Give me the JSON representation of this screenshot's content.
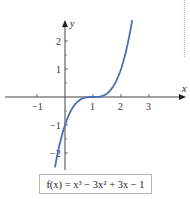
{
  "chart_data": {
    "type": "line",
    "title": "",
    "function": "f(x) = x^3 - 3x^2 + 3x - 1",
    "xlabel": "x",
    "ylabel": "y",
    "x_ticks": [
      -1,
      0,
      1,
      2,
      3
    ],
    "x_tick_labels": [
      "-1",
      "1",
      "2",
      "3"
    ],
    "y_ticks": [
      -2,
      -1,
      0,
      1,
      2
    ],
    "y_tick_labels": [
      "2",
      "1",
      "-1",
      "-2"
    ],
    "xlim": [
      -2.2,
      4.2
    ],
    "ylim": [
      -2.7,
      2.7
    ],
    "grid": false,
    "series": [
      {
        "name": "f(x)",
        "color": "#4a6fb5",
        "x": [
          -0.4,
          -0.2,
          0,
          0.2,
          0.4,
          0.6,
          0.8,
          1.0,
          1.2,
          1.4,
          1.6,
          1.8,
          2.0,
          2.2,
          2.4
        ],
        "y": [
          -2.74,
          -1.73,
          -1,
          -0.51,
          -0.22,
          -0.06,
          -0.01,
          0,
          0.01,
          0.06,
          0.22,
          0.51,
          1,
          1.73,
          2.74
        ]
      }
    ]
  },
  "labels": {
    "x_axis": "x",
    "y_axis": "y",
    "x_ticks": {
      "m1": "−1",
      "p1": "1",
      "p2": "2",
      "p3": "3"
    },
    "y_ticks": {
      "p2": "2",
      "p1": "1",
      "m1": "−1",
      "m2": "−2"
    }
  },
  "formula": {
    "text": "f(x) = x³ − 3x² + 3x − 1"
  },
  "colors": {
    "curve": "#4a6fb5",
    "axis": "#444444",
    "guide": "#e7a3a8"
  }
}
